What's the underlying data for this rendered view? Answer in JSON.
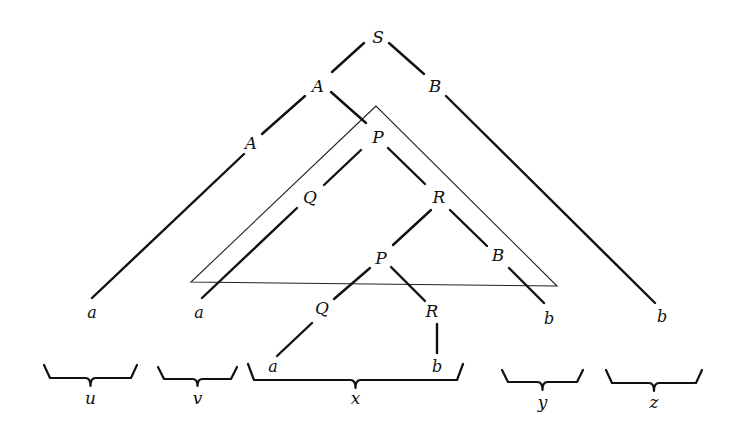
{
  "diagram": {
    "colors": {
      "ink": "#111111",
      "background": "#ffffff"
    },
    "nodes": [
      {
        "id": "S",
        "label": "S",
        "x": 378,
        "y": 37,
        "kind": "nonterminal"
      },
      {
        "id": "A1",
        "label": "A",
        "x": 318,
        "y": 86,
        "kind": "nonterminal"
      },
      {
        "id": "B1",
        "label": "B",
        "x": 435,
        "y": 86,
        "kind": "nonterminal"
      },
      {
        "id": "A2",
        "label": "A",
        "x": 251,
        "y": 143,
        "kind": "nonterminal"
      },
      {
        "id": "P1",
        "label": "P",
        "x": 378,
        "y": 137,
        "kind": "nonterminal"
      },
      {
        "id": "Q1",
        "label": "Q",
        "x": 310,
        "y": 197,
        "kind": "nonterminal"
      },
      {
        "id": "R1",
        "label": "R",
        "x": 439,
        "y": 197,
        "kind": "nonterminal"
      },
      {
        "id": "P2",
        "label": "P",
        "x": 381,
        "y": 258,
        "kind": "nonterminal"
      },
      {
        "id": "B2",
        "label": "B",
        "x": 498,
        "y": 255,
        "kind": "nonterminal"
      },
      {
        "id": "Q2",
        "label": "Q",
        "x": 322,
        "y": 308,
        "kind": "nonterminal"
      },
      {
        "id": "R2",
        "label": "R",
        "x": 432,
        "y": 311,
        "kind": "nonterminal"
      },
      {
        "id": "a1",
        "label": "a",
        "x": 92,
        "y": 312,
        "kind": "terminal"
      },
      {
        "id": "a2",
        "label": "a",
        "x": 199,
        "y": 312,
        "kind": "terminal"
      },
      {
        "id": "b1",
        "label": "b",
        "x": 549,
        "y": 318,
        "kind": "terminal"
      },
      {
        "id": "b2",
        "label": "b",
        "x": 662,
        "y": 316,
        "kind": "terminal"
      },
      {
        "id": "a3",
        "label": "a",
        "x": 273,
        "y": 366,
        "kind": "terminal"
      },
      {
        "id": "b3",
        "label": "b",
        "x": 437,
        "y": 366,
        "kind": "terminal"
      }
    ],
    "edges": [
      {
        "from": "S",
        "to": "A1",
        "x1": 364,
        "y1": 43,
        "x2": 332,
        "y2": 72
      },
      {
        "from": "S",
        "to": "B1",
        "x1": 389,
        "y1": 43,
        "x2": 424,
        "y2": 74
      },
      {
        "from": "A1",
        "to": "A2",
        "x1": 305,
        "y1": 96,
        "x2": 262,
        "y2": 134
      },
      {
        "from": "A1",
        "to": "P1",
        "x1": 331,
        "y1": 92,
        "x2": 366,
        "y2": 123
      },
      {
        "from": "B1",
        "to": "b2",
        "x1": 446,
        "y1": 96,
        "x2": 655,
        "y2": 303
      },
      {
        "from": "A2",
        "to": "a1",
        "x1": 244,
        "y1": 154,
        "x2": 92,
        "y2": 298
      },
      {
        "from": "P1",
        "to": "Q1",
        "x1": 361,
        "y1": 150,
        "x2": 324,
        "y2": 185
      },
      {
        "from": "P1",
        "to": "R1",
        "x1": 388,
        "y1": 148,
        "x2": 425,
        "y2": 184
      },
      {
        "from": "Q1",
        "to": "a2",
        "x1": 297,
        "y1": 208,
        "x2": 202,
        "y2": 298
      },
      {
        "from": "R1",
        "to": "P2",
        "x1": 431,
        "y1": 210,
        "x2": 393,
        "y2": 245
      },
      {
        "from": "R1",
        "to": "B2",
        "x1": 450,
        "y1": 210,
        "x2": 487,
        "y2": 246
      },
      {
        "from": "B2",
        "to": "b1",
        "x1": 509,
        "y1": 268,
        "x2": 544,
        "y2": 303
      },
      {
        "from": "P2",
        "to": "Q2",
        "x1": 370,
        "y1": 268,
        "x2": 334,
        "y2": 299
      },
      {
        "from": "P2",
        "to": "R2",
        "x1": 391,
        "y1": 267,
        "x2": 425,
        "y2": 301
      },
      {
        "from": "Q2",
        "to": "a3",
        "x1": 312,
        "y1": 323,
        "x2": 277,
        "y2": 356
      },
      {
        "from": "R2",
        "to": "b3",
        "x1": 437,
        "y1": 324,
        "x2": 437,
        "y2": 353
      }
    ],
    "subtree_triangle": {
      "label": "subtree rooted at P",
      "points": [
        [
          376,
          106
        ],
        [
          191,
          282
        ],
        [
          557,
          286
        ]
      ]
    },
    "braces": [
      {
        "id": "u",
        "label": "u",
        "x1": 44,
        "x2": 137,
        "top": 365,
        "bottom": 378,
        "tip": 386,
        "label_y": 398
      },
      {
        "id": "v",
        "label": "v",
        "x1": 158,
        "x2": 237,
        "top": 367,
        "bottom": 379,
        "tip": 386,
        "label_y": 398
      },
      {
        "id": "x",
        "label": "x",
        "x1": 248,
        "x2": 463,
        "top": 364,
        "bottom": 380,
        "tip": 388,
        "label_y": 398
      },
      {
        "id": "y",
        "label": "y",
        "x1": 502,
        "x2": 583,
        "top": 370,
        "bottom": 382,
        "tip": 390,
        "label_y": 402
      },
      {
        "id": "z",
        "label": "z",
        "x1": 606,
        "x2": 702,
        "top": 370,
        "bottom": 383,
        "tip": 391,
        "label_y": 402
      }
    ]
  }
}
